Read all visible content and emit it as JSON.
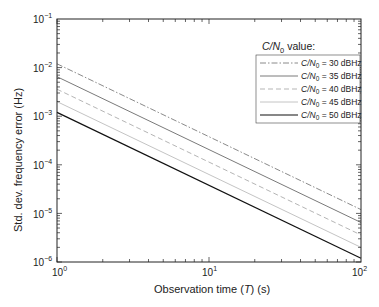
{
  "chart_data": {
    "type": "line",
    "title": "",
    "xlabel": "Observation time (T) (s)",
    "ylabel": "Std. dev. frequency error (Hz)",
    "xscale": "log",
    "yscale": "log",
    "xlim": [
      1,
      100
    ],
    "ylim": [
      1e-06,
      0.1
    ],
    "grid": false,
    "legend_position": "upper right (inside)",
    "legend_title": "C/N0 value:",
    "x": [
      1,
      100
    ],
    "x_tick_labels": [
      "10^0",
      "10^1",
      "10^2"
    ],
    "y_tick_labels": [
      "10^-1",
      "10^-2",
      "10^-3",
      "10^-4",
      "10^-5",
      "10^-6"
    ],
    "series": [
      {
        "name": "C/N0 = 30 dBHz",
        "style": "dash-dot",
        "color": "#8a8a8a",
        "values": [
          0.012,
          1.2e-05
        ]
      },
      {
        "name": "C/N0 = 35 dBHz",
        "style": "solid",
        "color": "#7a7a7a",
        "values": [
          0.0065,
          6.5e-06
        ]
      },
      {
        "name": "C/N0 = 40 dBHz",
        "style": "dashed",
        "color": "#b5b5b5",
        "values": [
          0.0036,
          3.6e-06
        ]
      },
      {
        "name": "C/N0 = 45 dBHz",
        "style": "solid",
        "color": "#c4c4c4",
        "values": [
          0.002,
          2e-06
        ]
      },
      {
        "name": "C/N0 = 50 dBHz",
        "style": "solid",
        "color": "#111111",
        "values": [
          0.0012,
          1.2e-06
        ]
      }
    ]
  },
  "axes": {
    "x_label_parts": {
      "pre": "Observation time (",
      "var": "T",
      "post": ") (s)"
    },
    "y_label": "Std. dev. frequency error (Hz)",
    "x_ticks": [
      {
        "base": "10",
        "exp": "0"
      },
      {
        "base": "10",
        "exp": "1"
      },
      {
        "base": "10",
        "exp": "2"
      }
    ],
    "y_ticks": [
      {
        "base": "10",
        "exp": "−1"
      },
      {
        "base": "10",
        "exp": "−2"
      },
      {
        "base": "10",
        "exp": "−3"
      },
      {
        "base": "10",
        "exp": "−4"
      },
      {
        "base": "10",
        "exp": "−5"
      },
      {
        "base": "10",
        "exp": "−6"
      }
    ]
  },
  "legend": {
    "title": {
      "var": "C/N",
      "sub": "0",
      "post": " value:"
    },
    "entries": [
      {
        "var": "C/N",
        "sub": "0",
        "post": " = 30 dBHz"
      },
      {
        "var": "C/N",
        "sub": "0",
        "post": " = 35 dBHz"
      },
      {
        "var": "C/N",
        "sub": "0",
        "post": " = 40 dBHz"
      },
      {
        "var": "C/N",
        "sub": "0",
        "post": " = 45 dBHz"
      },
      {
        "var": "C/N",
        "sub": "0",
        "post": " = 50 dBHz"
      }
    ]
  }
}
